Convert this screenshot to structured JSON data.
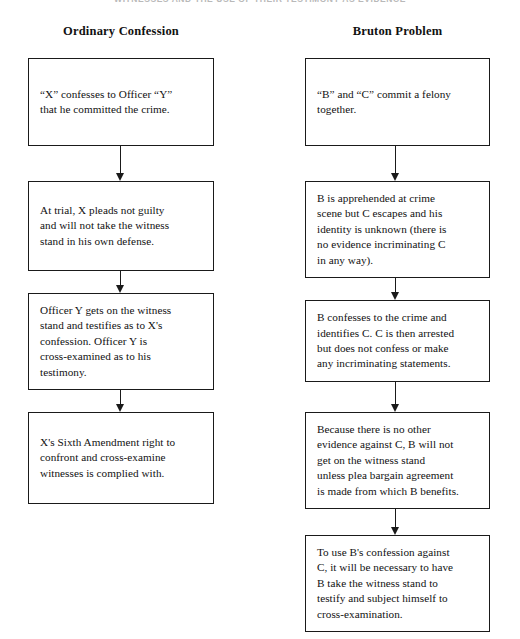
{
  "document": {
    "running_head": "WITNESSES AND THE USE OF THEIR TESTIMONY AS EVIDENCE",
    "ink_color": "#1a1a1a",
    "page_color": "#ffffff"
  },
  "diagram": {
    "type": "flowchart",
    "columns": [
      {
        "id": "ordinary-confession",
        "title": "Ordinary Confession",
        "steps": [
          {
            "index": 1,
            "text": "“X” confesses to Officer “Y”\nthat he committed the crime."
          },
          {
            "index": 2,
            "text": "At trial, X pleads not guilty\nand will not take the witness\nstand in his own defense."
          },
          {
            "index": 3,
            "text": "Officer Y gets on the witness\nstand and testifies as to X's\nconfession. Officer Y is\ncross-examined as to his\ntestimony."
          },
          {
            "index": 4,
            "text": "X's Sixth Amendment right to\nconfront and cross-examine\nwitnesses is complied with."
          }
        ]
      },
      {
        "id": "bruton-problem",
        "title": "Bruton Problem",
        "steps": [
          {
            "index": 1,
            "text": "“B” and “C” commit a felony\ntogether."
          },
          {
            "index": 2,
            "text": "B is apprehended at crime\nscene but C escapes and his\nidentity is unknown (there is\nno evidence incriminating C\nin any way)."
          },
          {
            "index": 3,
            "text": "B confesses to the crime and\nidentifies C. C is then arrested\nbut does not confess or make\nany incriminating statements."
          },
          {
            "index": 4,
            "text": "Because there is no other\nevidence against C, B will not\nget on the witness stand\nunless plea bargain agreement\nis made from which B benefits."
          },
          {
            "index": 5,
            "text": "To use B's confession against\nC, it will be necessary to have\nB take the witness stand to\ntestify and subject himself to\ncross-examination."
          }
        ]
      }
    ],
    "connector": {
      "style": "solid-line-with-filled-arrowhead",
      "direction": "down"
    }
  }
}
